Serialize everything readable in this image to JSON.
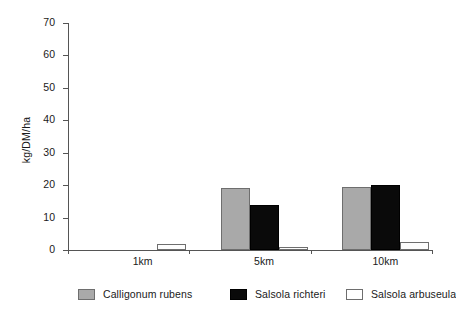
{
  "chart_data": {
    "type": "bar",
    "title": "",
    "subtitle": "",
    "xlabel": "",
    "ylabel": "kg/DM/ha",
    "categories": [
      "1km",
      "5km",
      "10km"
    ],
    "series": [
      {
        "name": "Calligonum rubens",
        "color": "#a9a9a9",
        "values": [
          0,
          19,
          19.5
        ]
      },
      {
        "name": "Salsola richteri",
        "color": "#0a0a0a",
        "values": [
          0,
          14,
          20
        ]
      },
      {
        "name": "Salsola arbuseula",
        "color": "#ffffff",
        "values": [
          2,
          1,
          2.5
        ]
      }
    ],
    "ylim": [
      0,
      70
    ],
    "yticks": [
      0,
      10,
      20,
      30,
      40,
      50,
      60,
      70
    ],
    "ytick_labels": [
      "0",
      "10",
      "20",
      "30",
      "40",
      "50",
      "60",
      "70"
    ],
    "grid": false,
    "legend_position": "bottom",
    "axis_color": "#555555"
  }
}
